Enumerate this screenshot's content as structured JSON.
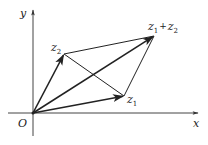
{
  "diagram": {
    "axes": {
      "x_label": "x",
      "y_label": "y",
      "origin_label": "O"
    },
    "points": {
      "origin": {
        "x": 33,
        "y": 113
      },
      "z1": {
        "x": 124,
        "y": 96
      },
      "z2": {
        "x": 64,
        "y": 54
      },
      "z1_plus_z2": {
        "x": 154,
        "y": 36
      }
    },
    "labels": {
      "z1_base": "z",
      "z1_sub": "1",
      "z2_base": "z",
      "z2_sub": "2",
      "sum_z1_base": "z",
      "sum_z1_sub": "1",
      "sum_plus": "+",
      "sum_z2_base": "z",
      "sum_z2_sub": "2"
    },
    "colors": {
      "stroke": "#222222",
      "background": "#ffffff"
    }
  }
}
